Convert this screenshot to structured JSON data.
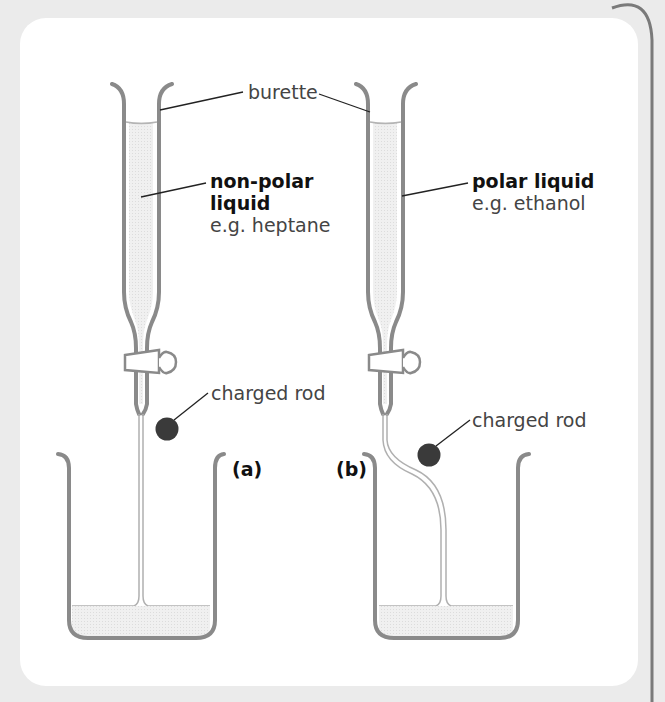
{
  "figure": {
    "labels": {
      "burette": "burette",
      "a_title_line1": "non-polar",
      "a_title_line2": "liquid",
      "a_example": "e.g. heptane",
      "b_title": "polar liquid",
      "b_example": "e.g. ethanol",
      "rod_a": "charged rod",
      "rod_b": "charged rod",
      "panel_a": "(a)",
      "panel_b": "(b)"
    },
    "colors": {
      "glass": "#8a8a8a",
      "liquid": "#ededed",
      "rod": "#3a3a3a",
      "leader": "#222222",
      "card": "#ffffff",
      "background": "#ebebeb"
    }
  }
}
